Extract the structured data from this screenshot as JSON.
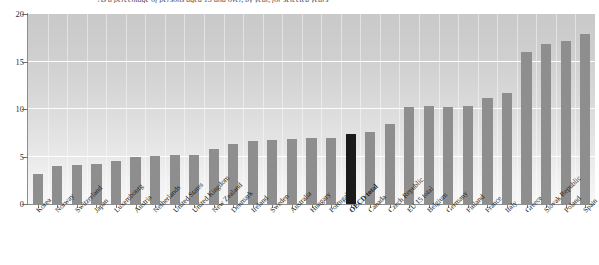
{
  "chart_data": {
    "type": "bar",
    "title": "As a percentage of persons aged 15 and over, by year, for selected years",
    "xlabel": "",
    "ylabel": "",
    "ylim": [
      0,
      20
    ],
    "yticks": [
      "0",
      "5",
      "10",
      "15",
      "20"
    ],
    "grid": true,
    "legend": "none",
    "highlight_category": "OECD total",
    "highlight_color": "#1a1a1a",
    "bar_color": "#8e8e8e",
    "categories": [
      "Korea",
      "Norway",
      "Switzerland",
      "Japan",
      "Luxembourg",
      "Austria",
      "Netherlands",
      "United States",
      "United Kingdom",
      "New Zealand",
      "Denmark",
      "Ireland",
      "Sweden",
      "Australia",
      "Hungary",
      "Portugal",
      "OECD total",
      "Canada",
      "Czech Republic",
      "EU 15 total",
      "Belgium",
      "Germany",
      "Finland",
      "France",
      "Italy",
      "Greece",
      "Slovak Republic",
      "Poland",
      "Spain"
    ],
    "values": [
      3.2,
      4.0,
      4.1,
      4.2,
      4.5,
      5.0,
      5.1,
      5.2,
      5.2,
      5.8,
      6.3,
      6.6,
      6.7,
      6.8,
      6.9,
      7.0,
      7.4,
      7.6,
      8.4,
      10.2,
      10.3,
      10.2,
      10.3,
      11.2,
      11.7,
      16.0,
      16.8,
      17.2,
      17.9
    ]
  }
}
